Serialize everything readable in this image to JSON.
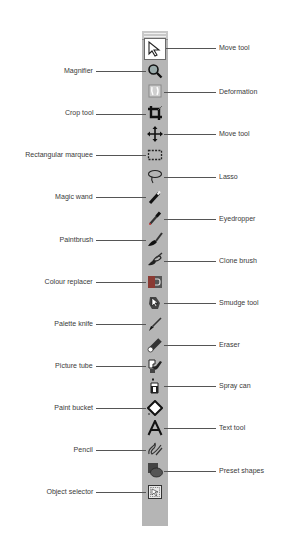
{
  "toolbar": {
    "background": "#b5b5b5",
    "tools": [
      {
        "label": "Move tool",
        "side": "right",
        "icon": "arrow-pointer-icon",
        "active": true
      },
      {
        "label": "Magnifier",
        "side": "left",
        "icon": "magnifier-icon"
      },
      {
        "label": "Deformation",
        "side": "right",
        "icon": "deformation-icon"
      },
      {
        "label": "Crop tool",
        "side": "left",
        "icon": "crop-icon"
      },
      {
        "label": "Move tool",
        "side": "right",
        "icon": "move-arrows-icon"
      },
      {
        "label": "Rectangular marquee",
        "side": "left",
        "icon": "marquee-icon"
      },
      {
        "label": "Lasso",
        "side": "right",
        "icon": "lasso-icon"
      },
      {
        "label": "Magic wand",
        "side": "left",
        "icon": "magic-wand-icon"
      },
      {
        "label": "Eyedropper",
        "side": "right",
        "icon": "eyedropper-icon"
      },
      {
        "label": "Paintbrush",
        "side": "left",
        "icon": "paintbrush-icon"
      },
      {
        "label": "Clone brush",
        "side": "right",
        "icon": "clone-brush-icon"
      },
      {
        "label": "Colour replacer",
        "side": "left",
        "icon": "colour-replacer-icon"
      },
      {
        "label": "Smudge tool",
        "side": "right",
        "icon": "smudge-icon"
      },
      {
        "label": "Palette knife",
        "side": "left",
        "icon": "palette-knife-icon"
      },
      {
        "label": "Eraser",
        "side": "right",
        "icon": "eraser-icon"
      },
      {
        "label": "Picture tube",
        "side": "left",
        "icon": "picture-tube-icon"
      },
      {
        "label": "Spray can",
        "side": "right",
        "icon": "spray-can-icon"
      },
      {
        "label": "Paint bucket",
        "side": "left",
        "icon": "paint-bucket-icon"
      },
      {
        "label": "Text tool",
        "side": "right",
        "icon": "text-icon"
      },
      {
        "label": "Pencil",
        "side": "left",
        "icon": "pencil-icon"
      },
      {
        "label": "Preset shapes",
        "side": "right",
        "icon": "preset-shapes-icon"
      },
      {
        "label": "Object selector",
        "side": "left",
        "icon": "object-selector-icon"
      }
    ]
  }
}
